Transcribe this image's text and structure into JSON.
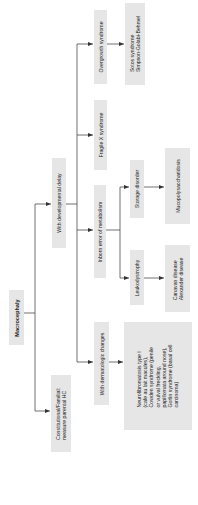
{
  "diagram": {
    "root": "Macrocephaly",
    "nodes": {
      "root": "Macrocephaly",
      "dev_delay": "With developmental delay",
      "constitutional": "Constitutional/Familial:\nmeasure parental HC",
      "overgrowth": "Overgrowth syndrome",
      "sotos": "Sotos syndrome\nSimpson-Golabi-Behmel",
      "fragile_x": "Fragile X syndrome",
      "inborn": "Inborn error of metabolism",
      "storage": "Storage disorder",
      "mucopoly": "Mucopolysaccharidosis",
      "leuko": "Leukodystrophy",
      "canavan": "Canavan disease\nAlexander disease",
      "dermatologic": "With dermatologic changes",
      "nf": "Neurofibromatosis type I\n(cafe au lait macules),\nCowden syndrome (penile\nor vulval freckling,\npapillomata around nose),\nGorlin syndrome (basal cell\ncarcinoma)"
    },
    "edges": [
      [
        "Macrocephaly",
        "With developmental delay"
      ],
      [
        "Macrocephaly",
        "Constitutional/Familial: measure parental HC"
      ],
      [
        "With developmental delay",
        "Overgrowth syndrome"
      ],
      [
        "With developmental delay",
        "Fragile X syndrome"
      ],
      [
        "With developmental delay",
        "Inborn error of metabolism"
      ],
      [
        "With developmental delay",
        "With dermatologic changes"
      ],
      [
        "Overgrowth syndrome",
        "Sotos syndrome / Simpson-Golabi-Behmel"
      ],
      [
        "Inborn error of metabolism",
        "Storage disorder"
      ],
      [
        "Inborn error of metabolism",
        "Leukodystrophy"
      ],
      [
        "Storage disorder",
        "Mucopolysaccharidosis"
      ],
      [
        "Leukodystrophy",
        "Canavan disease / Alexander disease"
      ],
      [
        "With dermatologic changes",
        "Neurofibromatosis type I / Cowden / Gorlin"
      ]
    ],
    "colors": {
      "box_fill": "#e6e6e6",
      "line": "#333333",
      "text": "#222222"
    }
  }
}
